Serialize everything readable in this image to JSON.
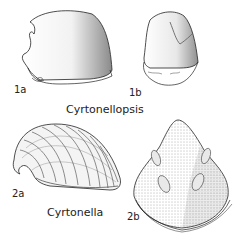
{
  "figure": {
    "genera": [
      {
        "name": "Cyrtonellopsis",
        "views": [
          {
            "label": "1a",
            "description": "lateral view of shell"
          },
          {
            "label": "1b",
            "description": "oblique view of shell"
          }
        ]
      },
      {
        "name": "Cyrtonella",
        "views": [
          {
            "label": "2a",
            "description": "lateral view of ribbed coiled shell"
          },
          {
            "label": "2b",
            "description": "interior view showing paired muscle scars"
          }
        ]
      }
    ],
    "colors": {
      "ink": "#222222",
      "background": "#ffffff"
    }
  }
}
